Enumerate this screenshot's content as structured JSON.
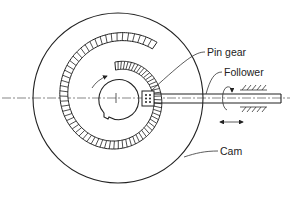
{
  "diagram": {
    "labels": {
      "pin_gear": "Pin gear",
      "follower": "Follower",
      "cam": "Cam"
    },
    "components": [
      {
        "id": "cam",
        "name": "Cam",
        "shape": "disk",
        "center": [
          118,
          98
        ],
        "radius": 85
      },
      {
        "id": "hub",
        "name": "Hub / shaft bore with keyway",
        "center": [
          116,
          98
        ],
        "radius": 20
      },
      {
        "id": "pin-track",
        "name": "Spiral pin track",
        "shape": "spiral"
      },
      {
        "id": "pin-gear",
        "name": "Pin gear",
        "position": [
          148,
          98
        ]
      },
      {
        "id": "follower",
        "name": "Follower rod",
        "from": [
          138,
          98
        ],
        "to": [
          282,
          98
        ]
      },
      {
        "id": "bearing",
        "name": "Guide bearing (hatched)",
        "x_range": [
          250,
          282
        ]
      }
    ],
    "arrows": {
      "cam_rotation": "clockwise",
      "follower_rotation": "rotary",
      "follower_translation": "bidirectional horizontal"
    },
    "colors": {
      "line": "#222222",
      "background": "#ffffff"
    }
  }
}
